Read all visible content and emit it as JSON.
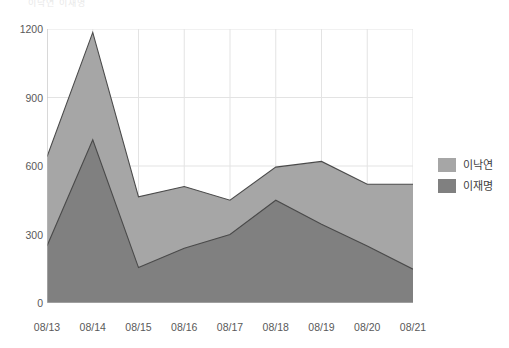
{
  "chart_data": {
    "type": "area",
    "title": "",
    "xlabel": "",
    "ylabel": "",
    "categories": [
      "08/13",
      "08/14",
      "08/15",
      "08/16",
      "08/17",
      "08/18",
      "08/19",
      "08/20",
      "08/21"
    ],
    "series": [
      {
        "name": "이낙연",
        "color": "#a6a6a6",
        "values": [
          640,
          1185,
          465,
          510,
          450,
          595,
          620,
          520,
          520
        ]
      },
      {
        "name": "이재명",
        "color": "#808080",
        "values": [
          250,
          715,
          155,
          240,
          300,
          450,
          345,
          250,
          148
        ]
      }
    ],
    "ylim": [
      0,
      1200
    ],
    "yticks": [
      0,
      300,
      600,
      900,
      1200
    ],
    "grid": true,
    "legend_position": "right"
  },
  "legend": {
    "items": [
      {
        "label": "이낙연",
        "color": "#a6a6a6"
      },
      {
        "label": "이재명",
        "color": "#808080"
      }
    ]
  },
  "axes": {
    "y_tick_labels": [
      "1200",
      "900",
      "600",
      "300",
      "0"
    ],
    "x_tick_labels": [
      "08/13",
      "08/14",
      "08/15",
      "08/16",
      "08/17",
      "08/18",
      "08/19",
      "08/20",
      "08/21"
    ]
  },
  "top_caption": "이낙연 이재명"
}
